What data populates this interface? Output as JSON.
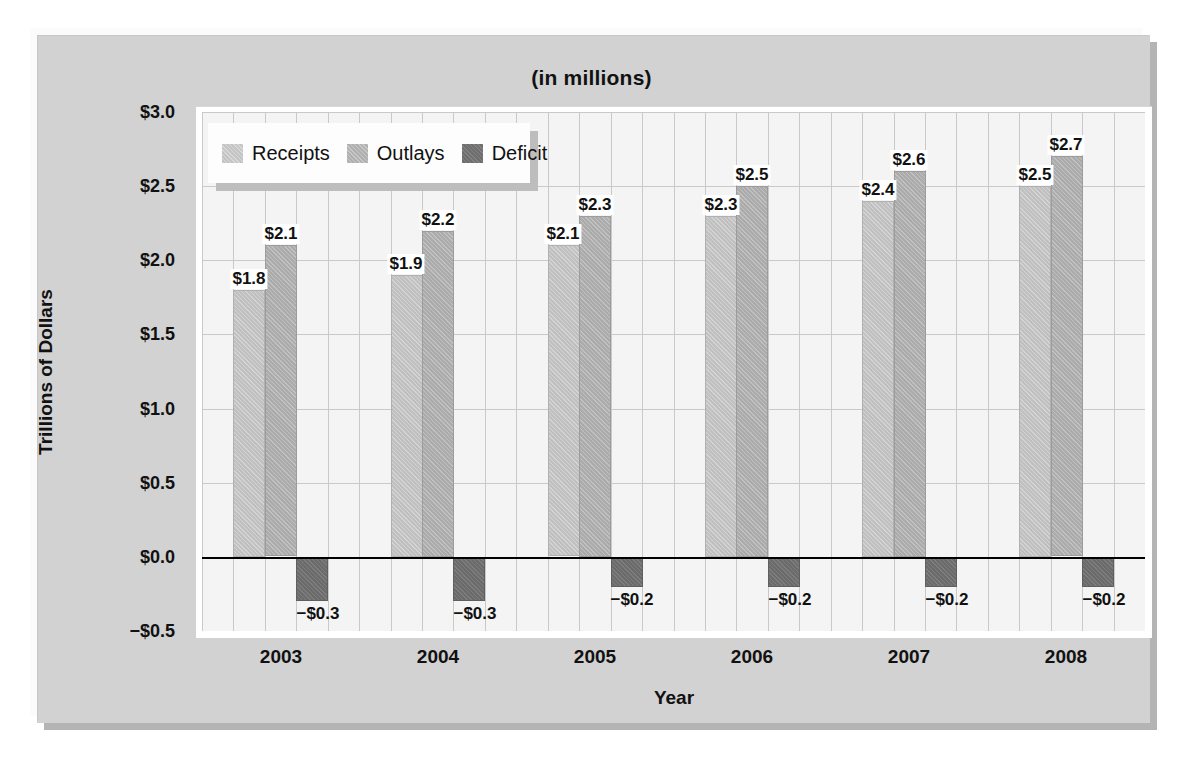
{
  "chart_data": {
    "type": "bar",
    "title": "(in millions)",
    "xlabel": "Year",
    "ylabel": "Trillions of Dollars",
    "categories": [
      "2003",
      "2004",
      "2005",
      "2006",
      "2007",
      "2008"
    ],
    "series": [
      {
        "name": "Receipts",
        "color": "#c0c0c0",
        "values": [
          1.8,
          1.9,
          2.1,
          2.3,
          2.4,
          2.5
        ],
        "labels": [
          "$1.8",
          "$1.9",
          "$2.1",
          "$2.3",
          "$2.4",
          "$2.5"
        ]
      },
      {
        "name": "Outlays",
        "color": "#ababab",
        "values": [
          2.1,
          2.2,
          2.3,
          2.5,
          2.6,
          2.7
        ],
        "labels": [
          "$2.1",
          "$2.2",
          "$2.3",
          "$2.5",
          "$2.6",
          "$2.7"
        ]
      },
      {
        "name": "Deficit",
        "color": "#6b6b6b",
        "values": [
          -0.3,
          -0.3,
          -0.2,
          -0.2,
          -0.2,
          -0.2
        ],
        "labels": [
          "−$0.3",
          "−$0.3",
          "−$0.2",
          "−$0.2",
          "−$0.2",
          "−$0.2"
        ]
      }
    ],
    "ylim": [
      -0.5,
      3.0
    ],
    "yticks": [
      3.0,
      2.5,
      2.0,
      1.5,
      1.0,
      0.5,
      0.0,
      -0.5
    ],
    "ytick_labels": [
      "$3.0",
      "$2.5",
      "$2.0",
      "$1.5",
      "$1.0",
      "$0.5",
      "$0.0",
      "−$0.5"
    ],
    "grid": true,
    "legend_position": "top-left",
    "legend_entries": [
      "Receipts",
      "Outlays",
      "Deficit"
    ]
  }
}
